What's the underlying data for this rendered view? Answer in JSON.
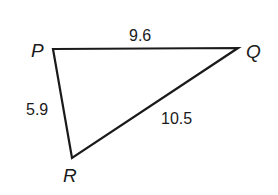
{
  "diagram": {
    "type": "triangle",
    "stroke_color": "#1a1a1a",
    "background_color": "#ffffff",
    "vertices": [
      {
        "name": "P",
        "x": 53,
        "y": 49,
        "label_x": 31,
        "label_y": 57
      },
      {
        "name": "Q",
        "x": 238,
        "y": 48,
        "label_x": 246,
        "label_y": 58
      },
      {
        "name": "R",
        "x": 72,
        "y": 158,
        "label_x": 63,
        "label_y": 182
      }
    ],
    "sides": [
      {
        "from": "P",
        "to": "Q",
        "length": "9.6",
        "label_x": 129,
        "label_y": 41
      },
      {
        "from": "P",
        "to": "R",
        "length": "5.9",
        "label_x": 26,
        "label_y": 115
      },
      {
        "from": "Q",
        "to": "R",
        "length": "10.5",
        "label_x": 161,
        "label_y": 124
      }
    ]
  },
  "labels": {
    "P": "P",
    "Q": "Q",
    "R": "R",
    "PQ": "9.6",
    "PR": "5.9",
    "QR": "10.5"
  }
}
